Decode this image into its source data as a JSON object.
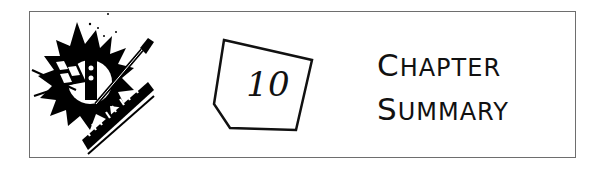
{
  "banner": {
    "chapter_number": "10",
    "title_line1_initial": "C",
    "title_line1_rest": "HAPTER",
    "title_line2_initial": "S",
    "title_line2_rest": "UMMARY",
    "clipart": "music-instruments-clipart-icon",
    "badge_shape": "pentagon-badge-icon",
    "border_color": "#6e6e6e",
    "ink_color": "#111111"
  }
}
